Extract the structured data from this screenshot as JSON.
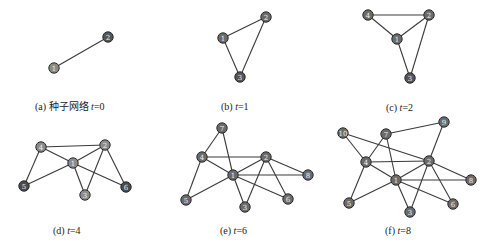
{
  "figure": {
    "panels": [
      {
        "id": "a",
        "caption_prefix": "(a) 种子网络",
        "caption_var": "t",
        "caption_eq": "=0",
        "caption_pos": [
          35,
          98
        ],
        "nodes": [
          {
            "id": "1",
            "x": 54,
            "y": 68,
            "fill": "#8a8a8a"
          },
          {
            "id": "2",
            "x": 108,
            "y": 37,
            "fill": "#555555"
          }
        ],
        "edges": [
          [
            "1",
            "2"
          ]
        ]
      },
      {
        "id": "b",
        "caption_prefix": "(b)",
        "caption_var": "t",
        "caption_eq": "=1",
        "caption_pos": [
          221,
          101
        ],
        "nodes": [
          {
            "id": "1",
            "x": 223,
            "y": 38,
            "fill": "#6a6a6a"
          },
          {
            "id": "2",
            "x": 266,
            "y": 17,
            "fill": "#6a6a6a"
          },
          {
            "id": "3",
            "x": 240,
            "y": 77,
            "fill": "#555555"
          }
        ],
        "edges": [
          [
            "1",
            "2"
          ],
          [
            "1",
            "3"
          ],
          [
            "2",
            "3"
          ]
        ]
      },
      {
        "id": "c",
        "caption_prefix": "(c)",
        "caption_var": "t",
        "caption_eq": "=2",
        "caption_pos": [
          386,
          102
        ],
        "nodes": [
          {
            "id": "4",
            "x": 368,
            "y": 15,
            "fill": "#6a6a6a"
          },
          {
            "id": "2",
            "x": 429,
            "y": 15,
            "fill": "#6a6a6a"
          },
          {
            "id": "1",
            "x": 397,
            "y": 39,
            "fill": "#6a6a6a"
          },
          {
            "id": "3",
            "x": 410,
            "y": 78,
            "fill": "#555555"
          }
        ],
        "edges": [
          [
            "4",
            "2"
          ],
          [
            "4",
            "1"
          ],
          [
            "1",
            "2"
          ],
          [
            "1",
            "3"
          ],
          [
            "2",
            "3"
          ]
        ]
      },
      {
        "id": "d",
        "caption_prefix": "(d)",
        "caption_var": "t",
        "caption_eq": "=4",
        "caption_pos": [
          53,
          225
        ],
        "nodes": [
          {
            "id": "4",
            "x": 41,
            "y": 147,
            "fill": "#8a8a8a"
          },
          {
            "id": "2",
            "x": 105,
            "y": 145,
            "fill": "#8a8a8a"
          },
          {
            "id": "1",
            "x": 73,
            "y": 163,
            "fill": "#8a8a8a"
          },
          {
            "id": "5",
            "x": 24,
            "y": 186,
            "fill": "#4a4a4a"
          },
          {
            "id": "3",
            "x": 85,
            "y": 195,
            "fill": "#8a8a8a"
          },
          {
            "id": "6",
            "x": 126,
            "y": 187,
            "fill": "#4a4a4a"
          }
        ],
        "edges": [
          [
            "4",
            "2"
          ],
          [
            "4",
            "1"
          ],
          [
            "4",
            "5"
          ],
          [
            "1",
            "2"
          ],
          [
            "1",
            "5"
          ],
          [
            "1",
            "3"
          ],
          [
            "1",
            "6"
          ],
          [
            "2",
            "3"
          ],
          [
            "2",
            "6"
          ]
        ]
      },
      {
        "id": "e",
        "caption_prefix": "(e)",
        "caption_var": "t",
        "caption_eq": "=6",
        "caption_pos": [
          220,
          225
        ],
        "nodes": [
          {
            "id": "7",
            "x": 222,
            "y": 128,
            "fill": "#6a6a6a"
          },
          {
            "id": "4",
            "x": 202,
            "y": 157,
            "fill": "#6a6a6a"
          },
          {
            "id": "2",
            "x": 266,
            "y": 157,
            "fill": "#6a6a6a"
          },
          {
            "id": "1",
            "x": 233,
            "y": 175,
            "fill": "#6a6a6a"
          },
          {
            "id": "8",
            "x": 308,
            "y": 175,
            "fill": "#6a6a6a"
          },
          {
            "id": "5",
            "x": 186,
            "y": 200,
            "fill": "#6a6a6a"
          },
          {
            "id": "3",
            "x": 245,
            "y": 207,
            "fill": "#6a6a6a"
          },
          {
            "id": "6",
            "x": 288,
            "y": 199,
            "fill": "#6a6a6a"
          }
        ],
        "edges": [
          [
            "7",
            "4"
          ],
          [
            "7",
            "1"
          ],
          [
            "4",
            "2"
          ],
          [
            "4",
            "1"
          ],
          [
            "4",
            "5"
          ],
          [
            "1",
            "2"
          ],
          [
            "1",
            "8"
          ],
          [
            "1",
            "5"
          ],
          [
            "1",
            "3"
          ],
          [
            "1",
            "6"
          ],
          [
            "2",
            "8"
          ],
          [
            "2",
            "3"
          ],
          [
            "2",
            "6"
          ]
        ]
      },
      {
        "id": "f",
        "caption_prefix": "(f)",
        "caption_var": "t",
        "caption_eq": "=8",
        "caption_pos": [
          385,
          225
        ],
        "nodes": [
          {
            "id": "10",
            "x": 343,
            "y": 133,
            "fill": "#6a6a6a"
          },
          {
            "id": "7",
            "x": 386,
            "y": 134,
            "fill": "#6a6a6a"
          },
          {
            "id": "9",
            "x": 444,
            "y": 122,
            "fill": "#6a6a6a"
          },
          {
            "id": "4",
            "x": 366,
            "y": 162,
            "fill": "#6a6a6a"
          },
          {
            "id": "2",
            "x": 429,
            "y": 161,
            "fill": "#6a6a6a"
          },
          {
            "id": "1",
            "x": 396,
            "y": 180,
            "fill": "#6a6a6a"
          },
          {
            "id": "8",
            "x": 471,
            "y": 180,
            "fill": "#6a6a6a"
          },
          {
            "id": "5",
            "x": 349,
            "y": 203,
            "fill": "#6a6a6a"
          },
          {
            "id": "3",
            "x": 410,
            "y": 212,
            "fill": "#6a6a6a"
          },
          {
            "id": "6",
            "x": 453,
            "y": 204,
            "fill": "#6a6a6a"
          }
        ],
        "edges": [
          [
            "10",
            "4"
          ],
          [
            "10",
            "2"
          ],
          [
            "7",
            "9"
          ],
          [
            "7",
            "4"
          ],
          [
            "7",
            "1"
          ],
          [
            "9",
            "2"
          ],
          [
            "4",
            "2"
          ],
          [
            "4",
            "1"
          ],
          [
            "4",
            "5"
          ],
          [
            "1",
            "2"
          ],
          [
            "1",
            "8"
          ],
          [
            "1",
            "5"
          ],
          [
            "1",
            "3"
          ],
          [
            "1",
            "6"
          ],
          [
            "2",
            "8"
          ],
          [
            "2",
            "3"
          ],
          [
            "2",
            "6"
          ]
        ]
      }
    ],
    "node_radius": 5.2
  }
}
